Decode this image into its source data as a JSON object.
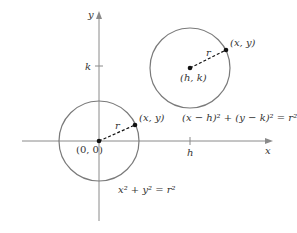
{
  "diagram": {
    "axes": {
      "x_label": "x",
      "y_label": "y"
    },
    "ticks": {
      "x_tick": "h",
      "y_tick": "k"
    },
    "circle_origin": {
      "center_label": "(0, 0)",
      "point_label": "(x, y)",
      "radius_label": "r",
      "equation": "x² + y² = r²"
    },
    "circle_shifted": {
      "center_label": "(h, k)",
      "point_label": "(x, y)",
      "radius_label": "r",
      "equation": "(x − h)² + (y − k)² = r²"
    },
    "colors": {
      "axis": "#8a8a8a",
      "circle": "#7a7a7a",
      "point": "#111111",
      "text": "#333333"
    }
  }
}
